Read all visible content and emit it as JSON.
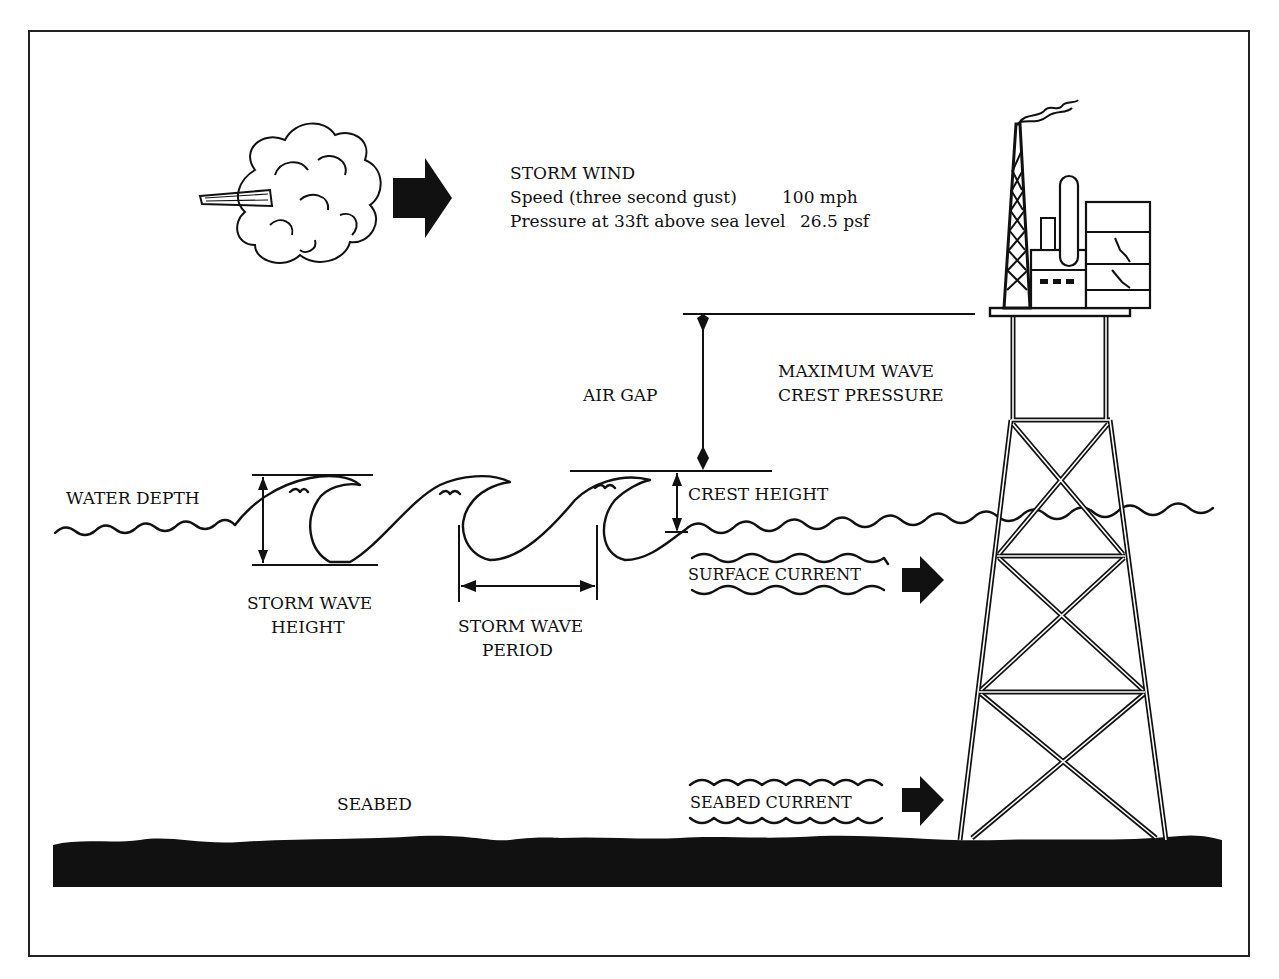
{
  "diagram": {
    "storm_wind": {
      "title": "STORM WIND",
      "speed_label": "Speed (three second gust)",
      "speed_value": "100 mph",
      "pressure_label": "Pressure at 33ft above sea level",
      "pressure_value": "26.5 psf"
    },
    "labels": {
      "air_gap": "AIR GAP",
      "max_wave_line1": "MAXIMUM WAVE",
      "max_wave_line2": "CREST PRESSURE",
      "crest_height": "CREST HEIGHT",
      "water_depth": "WATER DEPTH",
      "storm_wave_height_line1": "STORM WAVE",
      "storm_wave_height_line2": "HEIGHT",
      "storm_wave_period_line1": "STORM WAVE",
      "storm_wave_period_line2": "PERIOD",
      "surface_current": "SURFACE CURRENT",
      "seabed": "SEABED",
      "seabed_current": "SEABED CURRENT"
    },
    "icons": {
      "cloud": "storm-cloud-icon",
      "wind_arrow": "right-arrow-icon",
      "platform": "offshore-platform-icon",
      "current_arrow": "right-arrow-icon"
    },
    "colors": {
      "ink": "#111111",
      "paper": "#ffffff"
    }
  }
}
